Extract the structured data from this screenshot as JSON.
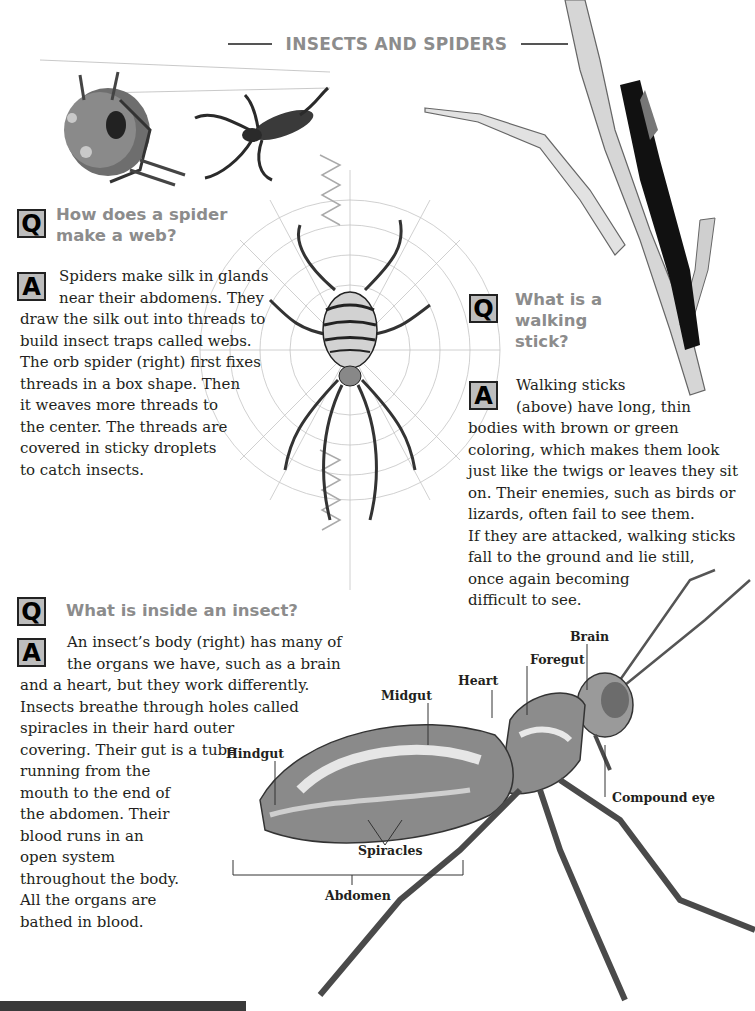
{
  "page": {
    "title": "INSECTS AND SPIDERS"
  },
  "sections": [
    {
      "id": "spider-web",
      "question_marker": "Q",
      "question_lines": [
        "How does a spider",
        "make a web?"
      ],
      "answer_marker": "A",
      "answer_lines": [
        "Spiders make silk in glands",
        "near their abdomens. They",
        "draw the silk out into threads to",
        "build insect traps called webs.",
        "The orb spider (right) first fixes",
        "threads in a box shape. Then",
        "it weaves more threads to",
        "the center. The threads are",
        "covered in sticky droplets",
        "to catch insects."
      ]
    },
    {
      "id": "walking-stick",
      "question_marker": "Q",
      "question_lines": [
        "What is a",
        "walking",
        "stick?"
      ],
      "answer_marker": "A",
      "answer_lines": [
        "Walking sticks",
        "(above) have long, thin",
        "bodies with brown or green",
        "coloring, which makes them look",
        "just like the twigs or leaves they sit",
        "on. Their enemies, such as birds or",
        "lizards, often fail to see them.",
        "If they are attacked, walking sticks",
        "fall to the ground and lie still,",
        "once again becoming",
        "difficult to see."
      ]
    },
    {
      "id": "inside-insect",
      "question_marker": "Q",
      "question_lines": [
        "What is inside an insect?"
      ],
      "answer_marker": "A",
      "answer_lines": [
        "An insect’s body (right) has many of",
        "the organs we have, such as a brain",
        "and a heart, but they work differently.",
        "Insects breathe through holes called",
        "spiracles in their hard outer",
        "covering. Their gut is a tube",
        "running from the",
        "mouth to the end of",
        "the abdomen. Their",
        "blood runs in an",
        "open system",
        "throughout the body.",
        "All the organs are",
        "bathed in blood."
      ]
    }
  ],
  "diagram_labels": {
    "brain": "Brain",
    "foregut": "Foregut",
    "heart": "Heart",
    "midgut": "Midgut",
    "hindgut": "Hindgut",
    "compound_eye": "Compound eye",
    "spiracles": "Spiracles",
    "abdomen": "Abdomen"
  },
  "colors": {
    "heading_gray": "#8c8c8c",
    "marker_box_fill": "#bdbdbd",
    "body_text": "#231f20",
    "bottom_bar": "#3a3a3a"
  }
}
